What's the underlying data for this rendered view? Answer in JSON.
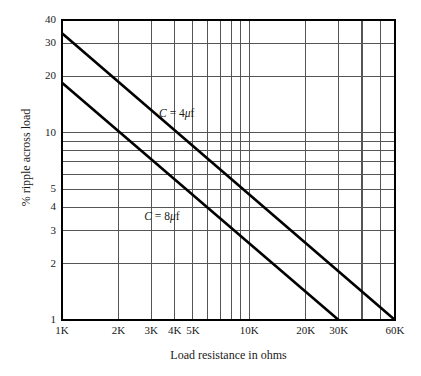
{
  "chart_data": {
    "type": "line",
    "title": "",
    "xlabel": "Load resistance in ohms",
    "ylabel": "% ripple across load",
    "xscale": "log",
    "yscale": "log",
    "xlim": [
      1000,
      60000
    ],
    "ylim": [
      1,
      40
    ],
    "grid": true,
    "legend_position": "inline-annotation",
    "x_ticks": [
      {
        "value": 1000,
        "label": "1K"
      },
      {
        "value": 2000,
        "label": "2K"
      },
      {
        "value": 3000,
        "label": "3K"
      },
      {
        "value": 4000,
        "label": "4K"
      },
      {
        "value": 5000,
        "label": "5K"
      },
      {
        "value": 6000,
        "label": ""
      },
      {
        "value": 7000,
        "label": ""
      },
      {
        "value": 8000,
        "label": ""
      },
      {
        "value": 9000,
        "label": ""
      },
      {
        "value": 10000,
        "label": "10K"
      },
      {
        "value": 20000,
        "label": "20K"
      },
      {
        "value": 30000,
        "label": "30K"
      },
      {
        "value": 40000,
        "label": ""
      },
      {
        "value": 50000,
        "label": ""
      },
      {
        "value": 60000,
        "label": "60K"
      }
    ],
    "y_ticks": [
      {
        "value": 1,
        "label": "1"
      },
      {
        "value": 2,
        "label": "2"
      },
      {
        "value": 3,
        "label": "3"
      },
      {
        "value": 4,
        "label": "4"
      },
      {
        "value": 5,
        "label": "5"
      },
      {
        "value": 6,
        "label": ""
      },
      {
        "value": 7,
        "label": ""
      },
      {
        "value": 8,
        "label": ""
      },
      {
        "value": 9,
        "label": ""
      },
      {
        "value": 10,
        "label": "10"
      },
      {
        "value": 20,
        "label": "20"
      },
      {
        "value": 30,
        "label": "30"
      },
      {
        "value": 40,
        "label": "40"
      }
    ],
    "series": [
      {
        "name": "C = 4μf",
        "annotation_html": "<i>C</i> = 4<i>μ</i>f",
        "points": [
          [
            1000,
            34.0
          ],
          [
            60000,
            1.0
          ]
        ]
      },
      {
        "name": "C = 8μf",
        "annotation_html": "<i>C</i> = 8<i>μ</i>f",
        "points": [
          [
            1000,
            18.5
          ],
          [
            30000,
            1.0
          ]
        ]
      }
    ],
    "colors": {
      "line": "#000000",
      "grid": "#555555",
      "axis": "#000000",
      "background": "#ffffff",
      "text": "#1a1a1a"
    }
  },
  "annotations": {
    "curve_4uf_label": "C = 4μf",
    "curve_8uf_label": "C = 8μf"
  }
}
